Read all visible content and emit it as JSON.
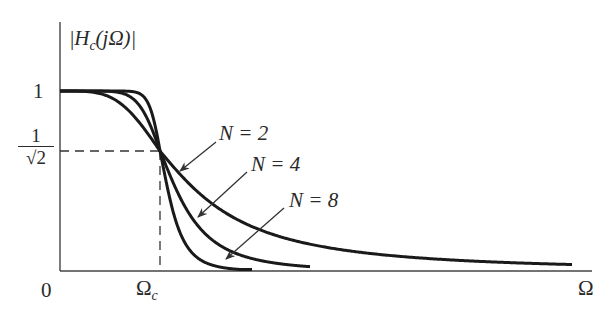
{
  "chart_data": {
    "type": "line",
    "title": "",
    "ylabel": "|H_c(jΩ)|",
    "xlabel": "Ω",
    "x_ticks": [
      "0",
      "Ω_c"
    ],
    "y_ticks": [
      "1",
      "1/√2"
    ],
    "xlim_relative_to_cutoff": [
      0,
      5.32
    ],
    "ylim": [
      0,
      1.25
    ],
    "grid": false,
    "legend": "inline arrow annotations",
    "reference_lines": [
      {
        "type": "horizontal-dashed",
        "y": 0.7071,
        "from_x": 0,
        "to_x": 1
      },
      {
        "type": "vertical-dashed",
        "x": 1,
        "from_y": 0,
        "to_y": 0.7071
      }
    ],
    "series": [
      {
        "name": "N = 2",
        "order": 2,
        "formula": "1/sqrt(1+(Ω/Ωc)^4)",
        "x_end": 5.12
      },
      {
        "name": "N = 4",
        "order": 4,
        "formula": "1/sqrt(1+(Ω/Ωc)^8)",
        "x_end": 2.5
      },
      {
        "name": "N = 8",
        "order": 8,
        "formula": "1/sqrt(1+(Ω/Ωc)^16)",
        "x_end": 1.92
      }
    ]
  },
  "labels": {
    "y_axis_title_prefix": "|",
    "y_axis_title_H": "H",
    "y_axis_title_sub": "c",
    "y_axis_title_rest": "(jΩ)|",
    "tick_one": "1",
    "tick_frac_num": "1",
    "tick_frac_den": "√2",
    "tick_zero": "0",
    "tick_omega_c_main": "Ω",
    "tick_omega_c_sub": "c",
    "x_axis_title": "Ω",
    "n2": "N = 2",
    "n4": "N = 4",
    "n8": "N = 8"
  }
}
